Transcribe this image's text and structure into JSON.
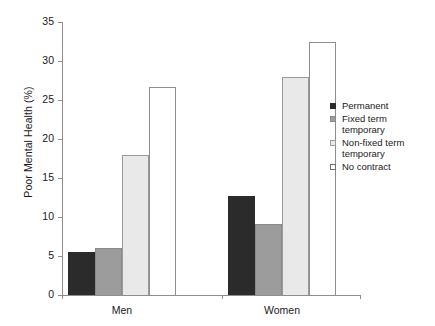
{
  "chart_data": {
    "type": "bar",
    "title": "",
    "subtitle": "",
    "xlabel": "",
    "ylabel": "Poor Mental Health (%)",
    "categories": [
      "Men",
      "Women"
    ],
    "series": [
      {
        "name": "Permanent",
        "values": [
          5.5,
          12.7
        ],
        "color": "#2b2b2b",
        "border": "#2b2b2b"
      },
      {
        "name": "Fixed term\ntemporary",
        "values": [
          6.0,
          9.1
        ],
        "color": "#9c9c9c",
        "border": "#8a8a8a"
      },
      {
        "name": "Non-fixed term\ntemporary",
        "values": [
          18.0,
          27.9
        ],
        "color": "#e9e9e9",
        "border": "#9a9a9a"
      },
      {
        "name": "No contract",
        "values": [
          26.7,
          32.5
        ],
        "color": "#ffffff",
        "border": "#8d8d8d"
      }
    ],
    "ylim": [
      0,
      35
    ],
    "yticks": [
      "0",
      "5",
      "10",
      "15",
      "20",
      "25",
      "30",
      "35"
    ],
    "ytick_values": [
      0,
      5,
      10,
      15,
      20,
      25,
      30,
      35
    ],
    "grid": false,
    "legend_position": "right",
    "axis_color": "#8d8d8d"
  },
  "legend": {
    "items": [
      {
        "label": "Permanent"
      },
      {
        "label": "Fixed term\ntemporary"
      },
      {
        "label": "Non-fixed term\ntemporary"
      },
      {
        "label": "No contract"
      }
    ]
  }
}
